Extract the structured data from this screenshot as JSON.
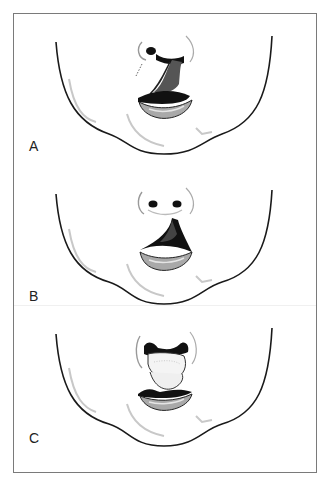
{
  "figure": {
    "panels": [
      {
        "id": "A",
        "label": "A",
        "description": "Unilateral cleft lip extending into nose"
      },
      {
        "id": "B",
        "label": "B",
        "description": "Cleft lip with open mouth, nostrils intact"
      },
      {
        "id": "C",
        "label": "C",
        "description": "Protruding tissue within mouth opening"
      }
    ],
    "colors": {
      "frame": "#7a7a7a",
      "outline": "#1a1a1a",
      "shading": "#bdbdbd",
      "lip": "#a9a9a9",
      "cavity": "#111111"
    }
  }
}
